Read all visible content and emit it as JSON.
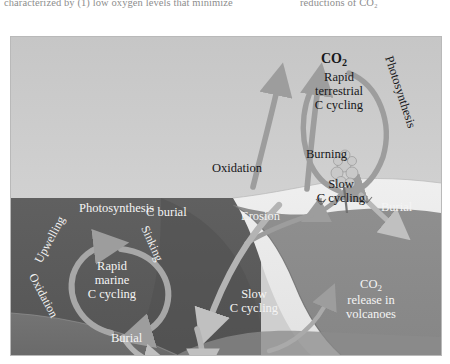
{
  "page_top_text": {
    "column_left": "characterized  by  (1)  low  oxygen  levels  that  minimize",
    "column_right": "reductions of CO₂"
  },
  "figure": {
    "name": "global-carbon-cycle-diagram",
    "regions": {
      "sky": "atmosphere",
      "ocean": "ocean",
      "crust": "continental-crust",
      "mantle": "mantle",
      "sediment": "marine-sediment"
    },
    "colors": {
      "sky": "#cacaca",
      "ocean": "#5b5b5b",
      "ocean_deep": "#4f4f4f",
      "crust_light": "#ededed",
      "crust_mid": "#7e7e7e",
      "mantle": "#8b8b8b",
      "sediment": "#6f6f6f",
      "arrow_gray": "#9a9a9a",
      "arrow_pale": "#b9b9b9",
      "arrow_dark": "#8a8a8a",
      "text_dark": "#17181a",
      "text_light": "#f4f4f4",
      "frame": "#b9b9b9"
    },
    "labels": {
      "co2_atmosphere": "CO",
      "co2_atmosphere_sub": "2",
      "rapid_terrestrial_l1": "Rapid",
      "rapid_terrestrial_l2": "terrestrial",
      "rapid_terrestrial_l3": "C  cycling",
      "photosynthesis_land": "Photosynthesis",
      "burning": "Burning",
      "oxidation_land": "Oxidation",
      "slow_c_cycling_upper_l1": "Slow",
      "slow_c_cycling_upper_l2": "C cycling",
      "burial_right": "Burial",
      "erosion": "Erosion",
      "c_burial": "C  burial",
      "photosynthesis_marine": "Photosynthesis",
      "upwelling": "Upwelling",
      "sinking": "Sinking",
      "oxidation_marine": "Oxidation",
      "rapid_marine_l1": "Rapid",
      "rapid_marine_l2": "marine",
      "rapid_marine_l3": "C  cycling",
      "burial_marine": "Burial",
      "slow_c_cycling_lower_l1": "Slow",
      "slow_c_cycling_lower_l2": "C cycling",
      "co2_volcano": "CO",
      "co2_volcano_sub": "2",
      "volcano_l2": "release in",
      "volcano_l3": "volcanoes"
    }
  }
}
